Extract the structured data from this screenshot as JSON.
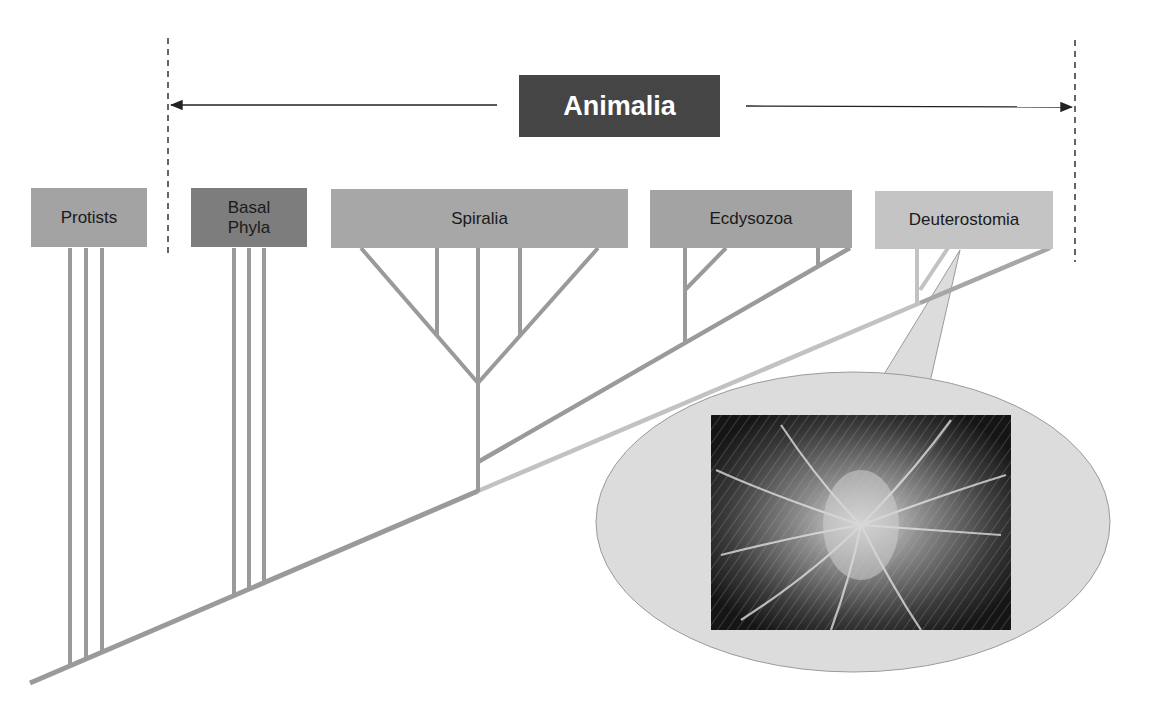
{
  "diagram": {
    "title": "Animalia",
    "groups": [
      {
        "id": "protists",
        "label": "Protists",
        "color": "#a3a3a3"
      },
      {
        "id": "basal-phyla",
        "label": "Basal Phyla",
        "color": "#7d7d7d"
      },
      {
        "id": "spiralia",
        "label": "Spiralia",
        "color": "#a7a7a7"
      },
      {
        "id": "ecdysozoa",
        "label": "Ecdysozoa",
        "color": "#a3a3a3"
      },
      {
        "id": "deuterostomia",
        "label": "Deuterostomia",
        "color": "#c4c4c4"
      }
    ],
    "callout": {
      "subject": "Deuterostomia",
      "image_description": "feather star (crinoid) photograph"
    },
    "colors": {
      "branch": "#9a9a9a",
      "branch_light": "#c2c2c2",
      "title_bg": "#454545",
      "callout_fill": "#dcdcdc",
      "dashed_line": "#333333"
    }
  }
}
